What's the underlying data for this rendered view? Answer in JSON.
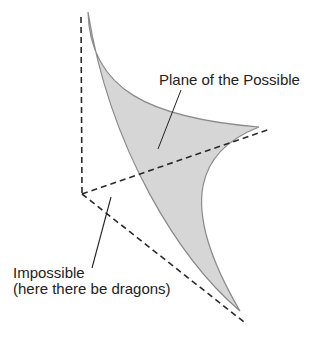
{
  "diagram": {
    "labels": {
      "possible": "Plane of the Possible",
      "impossible_line1": "Impossible",
      "impossible_line2": "(here there be dragons)"
    },
    "colors": {
      "background": "#ffffff",
      "plane_fill": "#d6d6d6",
      "plane_stroke": "#8a8a8a",
      "axis": "#2a2a2a",
      "leader": "#222222",
      "text": "#222222"
    },
    "axes": {
      "style": "dashed",
      "origin": [
        82,
        194
      ],
      "vertical_end": [
        81,
        17
      ],
      "right_end": [
        270,
        129
      ],
      "diagonal_end": [
        244,
        322
      ]
    },
    "plane_tips": {
      "top": [
        88,
        12
      ],
      "right": [
        259,
        127
      ],
      "bottom": [
        240,
        311
      ]
    }
  }
}
